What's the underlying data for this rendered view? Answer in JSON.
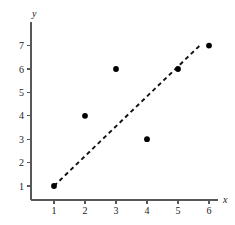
{
  "chart_data": {
    "type": "scatter",
    "title": "",
    "xlabel": "x",
    "ylabel": "y",
    "xlim": [
      0,
      6.6
    ],
    "ylim": [
      0,
      7.5
    ],
    "xticks": [
      1,
      2,
      3,
      4,
      5,
      6
    ],
    "yticks": [
      1,
      2,
      3,
      4,
      5,
      6,
      7
    ],
    "grid": false,
    "legend": null,
    "points": [
      {
        "x": 1,
        "y": 1
      },
      {
        "x": 2,
        "y": 4
      },
      {
        "x": 3,
        "y": 6
      },
      {
        "x": 4,
        "y": 3
      },
      {
        "x": 5,
        "y": 6
      },
      {
        "x": 6,
        "y": 7
      }
    ],
    "marker": {
      "shape": "circle",
      "color": "#000000",
      "radius_px": 2.9
    },
    "trend_line": {
      "style": "dashed",
      "color": "#111111",
      "start": {
        "x": 1,
        "y": 1
      },
      "end": {
        "x": 5.7,
        "y": 7.0
      }
    },
    "axis_color": "#58585a"
  }
}
